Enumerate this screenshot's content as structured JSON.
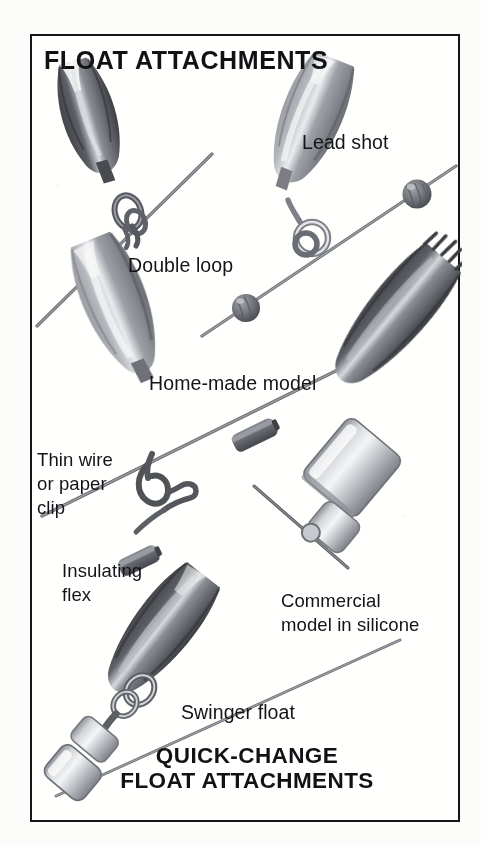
{
  "page": {
    "background_color": "#fcfcfb",
    "frame_color": "#15161a",
    "ink_color": "#131418"
  },
  "header": {
    "title": "FLOAT ATTACHMENTS"
  },
  "footer": {
    "line1": "QUICK-CHANGE",
    "line2": "FLOAT ATTACHMENTS"
  },
  "figure": {
    "caption_double_loop": "Double loop",
    "caption_lead_shot": "Lead shot",
    "caption_home_made": "Home-made model",
    "caption_thin_wire_l1": "Thin wire",
    "caption_thin_wire_l2": "or paper",
    "caption_thin_wire_l3": "clip",
    "caption_insulating_l1": "Insulating",
    "caption_insulating_l2": "flex",
    "caption_commercial_l1": "Commercial",
    "caption_commercial_l2": "model in silicone",
    "caption_swinger": "Swinger float"
  },
  "illustration": {
    "style": "halftone grayscale line drawing",
    "float_dark": "#4e5055",
    "float_mid": "#7d8087",
    "float_light": "#c9ccd1",
    "line_color": "#6e7176",
    "items": [
      {
        "name": "float-double-loop",
        "description": "dark tapered float body with double wire loop on line"
      },
      {
        "name": "float-lead-shot",
        "description": "grey tapered float with eye ring, two lead shot beads pinched on line"
      },
      {
        "name": "float-home-made",
        "description": "grey tapered float with thin wire / paper clip hook and insulating flex sleeve"
      },
      {
        "name": "float-commercial-silicone",
        "description": "dark float stem inside light silicone sleeve on line"
      },
      {
        "name": "float-swinger",
        "description": "dark tapered float on swivel link with silicone sleeve on line"
      }
    ]
  }
}
